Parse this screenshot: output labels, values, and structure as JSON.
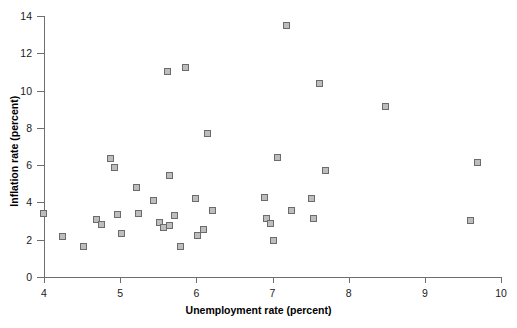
{
  "chart_data": {
    "type": "scatter",
    "title": "",
    "xlabel": "Unemployment rate (percent)",
    "ylabel": "Inflation rate (percent)",
    "xlim": [
      4,
      10
    ],
    "ylim": [
      0,
      14
    ],
    "xticks": [
      4,
      5,
      6,
      7,
      8,
      9,
      10
    ],
    "yticks": [
      0,
      2,
      4,
      6,
      8,
      10,
      12,
      14
    ],
    "xtick_labels": [
      "4",
      "5",
      "6",
      "7",
      "8",
      "9",
      "10"
    ],
    "ytick_labels": [
      "0",
      "2",
      "4",
      "6",
      "8",
      "10",
      "12",
      "14"
    ],
    "grid": false,
    "legend": null,
    "marker_style": "square",
    "marker_fill": "#bdbdbd",
    "marker_edge": "#6b6b6b",
    "axis_color": "#6e6e6e",
    "points": [
      {
        "x": 4.0,
        "y": 3.4
      },
      {
        "x": 4.25,
        "y": 2.15
      },
      {
        "x": 4.52,
        "y": 1.6
      },
      {
        "x": 4.7,
        "y": 3.05
      },
      {
        "x": 4.76,
        "y": 2.8
      },
      {
        "x": 4.88,
        "y": 6.35
      },
      {
        "x": 4.93,
        "y": 5.85
      },
      {
        "x": 4.97,
        "y": 3.35
      },
      {
        "x": 5.02,
        "y": 2.3
      },
      {
        "x": 5.22,
        "y": 4.75
      },
      {
        "x": 5.25,
        "y": 3.4
      },
      {
        "x": 5.45,
        "y": 4.1
      },
      {
        "x": 5.52,
        "y": 2.9
      },
      {
        "x": 5.57,
        "y": 2.65
      },
      {
        "x": 5.63,
        "y": 11.0
      },
      {
        "x": 5.65,
        "y": 5.4
      },
      {
        "x": 5.66,
        "y": 2.75
      },
      {
        "x": 5.72,
        "y": 3.25
      },
      {
        "x": 5.8,
        "y": 1.6
      },
      {
        "x": 5.87,
        "y": 11.2
      },
      {
        "x": 6.0,
        "y": 4.2
      },
      {
        "x": 6.02,
        "y": 2.2
      },
      {
        "x": 6.1,
        "y": 2.5
      },
      {
        "x": 6.15,
        "y": 7.65
      },
      {
        "x": 6.22,
        "y": 3.55
      },
      {
        "x": 6.9,
        "y": 4.25
      },
      {
        "x": 6.93,
        "y": 3.1
      },
      {
        "x": 6.98,
        "y": 2.85
      },
      {
        "x": 7.02,
        "y": 1.95
      },
      {
        "x": 7.07,
        "y": 6.4
      },
      {
        "x": 7.19,
        "y": 13.45
      },
      {
        "x": 7.25,
        "y": 3.55
      },
      {
        "x": 7.52,
        "y": 4.2
      },
      {
        "x": 7.55,
        "y": 3.1
      },
      {
        "x": 7.63,
        "y": 10.35
      },
      {
        "x": 7.7,
        "y": 5.7
      },
      {
        "x": 8.49,
        "y": 9.1
      },
      {
        "x": 9.6,
        "y": 3.0
      },
      {
        "x": 9.7,
        "y": 6.1
      }
    ]
  }
}
